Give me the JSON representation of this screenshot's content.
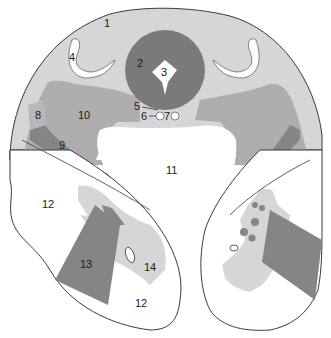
{
  "diagram": {
    "type": "anatomical-cross-section",
    "colors": {
      "background": "#ffffff",
      "outline": "#3a3a3a",
      "tissue_light": "#d6d6d6",
      "tissue_medium": "#aeaeae",
      "tissue_dark": "#858585",
      "core_dark": "#7a7a7a",
      "cavity": "#ffffff"
    },
    "labels": [
      {
        "id": "1",
        "text": "1",
        "x": 107,
        "y": 26
      },
      {
        "id": "2",
        "text": "2",
        "x": 140,
        "y": 66
      },
      {
        "id": "3",
        "text": "3",
        "x": 163,
        "y": 75
      },
      {
        "id": "4",
        "text": "4",
        "x": 72,
        "y": 60
      },
      {
        "id": "5",
        "text": "5",
        "x": 136,
        "y": 109
      },
      {
        "id": "6",
        "text": "6",
        "x": 142,
        "y": 119
      },
      {
        "id": "7",
        "text": "7",
        "x": 166,
        "y": 118
      },
      {
        "id": "8",
        "text": "8",
        "x": 36,
        "y": 118
      },
      {
        "id": "9",
        "text": "9",
        "x": 60,
        "y": 148
      },
      {
        "id": "10",
        "text": "10",
        "x": 79,
        "y": 118
      },
      {
        "id": "11",
        "text": "11",
        "x": 167,
        "y": 173
      },
      {
        "id": "12a",
        "text": "12",
        "x": 42,
        "y": 207
      },
      {
        "id": "13",
        "text": "13",
        "x": 79,
        "y": 267
      },
      {
        "id": "14",
        "text": "14",
        "x": 144,
        "y": 270
      },
      {
        "id": "12b",
        "text": "12",
        "x": 134,
        "y": 306
      }
    ]
  }
}
